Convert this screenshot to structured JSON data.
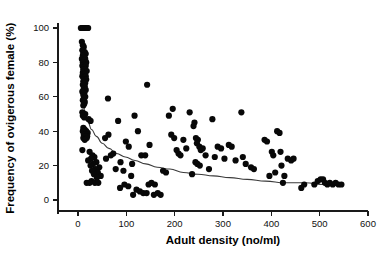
{
  "chart_data": {
    "type": "scatter",
    "title": "",
    "xlabel": "Adult density (no/ml)",
    "ylabel": "Frequency of ovigerous female (%)",
    "xlim": [
      -40,
      600
    ],
    "ylim": [
      -8,
      105
    ],
    "xticks": [
      0,
      100,
      200,
      300,
      400,
      500,
      600
    ],
    "yticks": [
      0,
      20,
      40,
      60,
      80,
      100
    ],
    "xtick_labels": [
      "0",
      "100",
      "200",
      "300",
      "400",
      "500",
      "600"
    ],
    "ytick_labels": [
      "0",
      "20",
      "40",
      "60",
      "80",
      "100"
    ],
    "grid": false,
    "legend": null,
    "marker_color": "#080808",
    "marker_size": 3.1,
    "curve_color": "#3b3b3b",
    "axis_color": "#1a1a1a",
    "background_color": "#ffffff",
    "series": [
      {
        "name": "Observations",
        "marker": "filled-circle",
        "points": [
          [
            6,
            100
          ],
          [
            9,
            100
          ],
          [
            11,
            100
          ],
          [
            13,
            100
          ],
          [
            15,
            100
          ],
          [
            17,
            100
          ],
          [
            19,
            100
          ],
          [
            21,
            100
          ],
          [
            8,
            92
          ],
          [
            10,
            90
          ],
          [
            12,
            89
          ],
          [
            9,
            87
          ],
          [
            14,
            86
          ],
          [
            11,
            85
          ],
          [
            16,
            85
          ],
          [
            10,
            84
          ],
          [
            13,
            83
          ],
          [
            8,
            82
          ],
          [
            15,
            82
          ],
          [
            12,
            81
          ],
          [
            17,
            80
          ],
          [
            10,
            80
          ],
          [
            14,
            79
          ],
          [
            9,
            78
          ],
          [
            16,
            78
          ],
          [
            12,
            77
          ],
          [
            11,
            76
          ],
          [
            15,
            76
          ],
          [
            13,
            75
          ],
          [
            18,
            75
          ],
          [
            10,
            74
          ],
          [
            14,
            73
          ],
          [
            9,
            72
          ],
          [
            16,
            72
          ],
          [
            12,
            71
          ],
          [
            13,
            70
          ],
          [
            17,
            70
          ],
          [
            11,
            69
          ],
          [
            15,
            68
          ],
          [
            10,
            67
          ],
          [
            14,
            66
          ],
          [
            12,
            65
          ],
          [
            16,
            64
          ],
          [
            9,
            63
          ],
          [
            13,
            62
          ],
          [
            11,
            61
          ],
          [
            15,
            60
          ],
          [
            12,
            59
          ],
          [
            10,
            58
          ],
          [
            14,
            57
          ],
          [
            13,
            56
          ],
          [
            11,
            55
          ],
          [
            9,
            51
          ],
          [
            12,
            50
          ],
          [
            15,
            50
          ],
          [
            10,
            49
          ],
          [
            13,
            48
          ],
          [
            22,
            47
          ],
          [
            26,
            46
          ],
          [
            11,
            42
          ],
          [
            14,
            41
          ],
          [
            17,
            40
          ],
          [
            10,
            40
          ],
          [
            20,
            39
          ],
          [
            13,
            39
          ],
          [
            16,
            38
          ],
          [
            12,
            38
          ],
          [
            19,
            37
          ],
          [
            15,
            37
          ],
          [
            11,
            36
          ],
          [
            18,
            36
          ],
          [
            14,
            35
          ],
          [
            9,
            29
          ],
          [
            24,
            28
          ],
          [
            30,
            26
          ],
          [
            34,
            25
          ],
          [
            27,
            24
          ],
          [
            21,
            23
          ],
          [
            38,
            22
          ],
          [
            31,
            21
          ],
          [
            26,
            20
          ],
          [
            44,
            19
          ],
          [
            36,
            18
          ],
          [
            29,
            17
          ],
          [
            41,
            16
          ],
          [
            33,
            15
          ],
          [
            47,
            14
          ],
          [
            39,
            13
          ],
          [
            28,
            11
          ],
          [
            35,
            10
          ],
          [
            42,
            10
          ],
          [
            18,
            10
          ],
          [
            24,
            10
          ],
          [
            62,
            59
          ],
          [
            143,
            67
          ],
          [
            83,
            46
          ],
          [
            117,
            49
          ],
          [
            63,
            38
          ],
          [
            56,
            36
          ],
          [
            99,
            34
          ],
          [
            124,
            40
          ],
          [
            105,
            31
          ],
          [
            148,
            32
          ],
          [
            68,
            26
          ],
          [
            73,
            27
          ],
          [
            88,
            22
          ],
          [
            112,
            21
          ],
          [
            131,
            26
          ],
          [
            139,
            26
          ],
          [
            58,
            24
          ],
          [
            78,
            18
          ],
          [
            94,
            17
          ],
          [
            110,
            14
          ],
          [
            96,
            9
          ],
          [
            104,
            8
          ],
          [
            87,
            7
          ],
          [
            121,
            6
          ],
          [
            128,
            5
          ],
          [
            114,
            3
          ],
          [
            135,
            4
          ],
          [
            142,
            4
          ],
          [
            146,
            9
          ],
          [
            152,
            10
          ],
          [
            159,
            9
          ],
          [
            165,
            4
          ],
          [
            171,
            3
          ],
          [
            157,
            3
          ],
          [
            176,
            17
          ],
          [
            182,
            16
          ],
          [
            188,
            49
          ],
          [
            196,
            53
          ],
          [
            193,
            38
          ],
          [
            199,
            36
          ],
          [
            204,
            29
          ],
          [
            208,
            27
          ],
          [
            212,
            26
          ],
          [
            218,
            35
          ],
          [
            224,
            30
          ],
          [
            231,
            51
          ],
          [
            236,
            15
          ],
          [
            241,
            45
          ],
          [
            239,
            43
          ],
          [
            244,
            36
          ],
          [
            248,
            35
          ],
          [
            246,
            33
          ],
          [
            251,
            31
          ],
          [
            254,
            29
          ],
          [
            258,
            30
          ],
          [
            243,
            22
          ],
          [
            247,
            21
          ],
          [
            252,
            20
          ],
          [
            264,
            26
          ],
          [
            271,
            18
          ],
          [
            278,
            47
          ],
          [
            283,
            25
          ],
          [
            289,
            31
          ],
          [
            296,
            30
          ],
          [
            303,
            24
          ],
          [
            312,
            32
          ],
          [
            318,
            31
          ],
          [
            326,
            23
          ],
          [
            338,
            51
          ],
          [
            341,
            25
          ],
          [
            347,
            21
          ],
          [
            358,
            19
          ],
          [
            364,
            18
          ],
          [
            386,
            35
          ],
          [
            391,
            34
          ],
          [
            396,
            14
          ],
          [
            401,
            28
          ],
          [
            404,
            26
          ],
          [
            408,
            16
          ],
          [
            412,
            40
          ],
          [
            417,
            39
          ],
          [
            419,
            28
          ],
          [
            421,
            20
          ],
          [
            424,
            10
          ],
          [
            427,
            14
          ],
          [
            434,
            24
          ],
          [
            441,
            23
          ],
          [
            446,
            24
          ],
          [
            462,
            7
          ],
          [
            468,
            9
          ],
          [
            489,
            9
          ],
          [
            496,
            11
          ],
          [
            502,
            12
          ],
          [
            507,
            12
          ],
          [
            511,
            10
          ],
          [
            516,
            9
          ],
          [
            521,
            10
          ],
          [
            527,
            9
          ],
          [
            533,
            10
          ],
          [
            539,
            9
          ],
          [
            545,
            9
          ]
        ]
      }
    ],
    "fitted_curve": {
      "name": "Fitted decay curve",
      "color": "#3b3b3b",
      "points": [
        [
          9,
          60
        ],
        [
          14,
          52
        ],
        [
          20,
          46
        ],
        [
          28,
          41
        ],
        [
          38,
          37
        ],
        [
          50,
          33
        ],
        [
          64,
          30
        ],
        [
          80,
          27
        ],
        [
          98,
          25
        ],
        [
          118,
          23
        ],
        [
          140,
          21
        ],
        [
          164,
          19
        ],
        [
          190,
          18
        ],
        [
          218,
          16
        ],
        [
          248,
          15
        ],
        [
          280,
          14
        ],
        [
          314,
          13
        ],
        [
          350,
          12
        ],
        [
          388,
          11
        ],
        [
          428,
          10
        ],
        [
          470,
          10
        ],
        [
          510,
          9
        ],
        [
          548,
          9
        ]
      ]
    }
  }
}
